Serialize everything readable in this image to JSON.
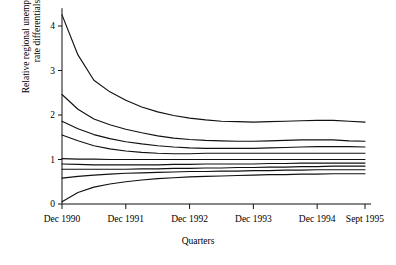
{
  "figure": {
    "background_color": "#ffffff",
    "line_color": "#111111"
  },
  "axes": {
    "y_title": "Relative regional unemployment rate differentials",
    "x_title": "Quarters"
  },
  "chart_data": {
    "type": "line",
    "title": "",
    "xlabel": "Quarters",
    "ylabel": "Relative regional unemployment rate differentials",
    "xlim": [
      0,
      19
    ],
    "ylim": [
      0,
      4.4
    ],
    "grid": false,
    "legend": "none",
    "x_tick_labels": [
      "Dec 1990",
      "Dec 1991",
      "Dec 1992",
      "Dec 1993",
      "Dec 1994",
      "Sept 1995"
    ],
    "x_tick_positions": [
      0,
      4,
      8,
      12,
      16,
      19
    ],
    "y_tick_labels": [
      "0",
      "1",
      "2",
      "3",
      "4"
    ],
    "y_tick_values": [
      0,
      1,
      2,
      3,
      4
    ],
    "x": [
      0,
      1,
      2,
      3,
      4,
      5,
      6,
      7,
      8,
      9,
      10,
      11,
      12,
      13,
      14,
      15,
      16,
      17,
      18,
      19
    ],
    "series": [
      {
        "name": "region-1",
        "values": [
          4.25,
          3.35,
          2.78,
          2.52,
          2.33,
          2.18,
          2.07,
          1.99,
          1.93,
          1.89,
          1.86,
          1.85,
          1.84,
          1.85,
          1.86,
          1.87,
          1.88,
          1.88,
          1.86,
          1.84
        ]
      },
      {
        "name": "region-2",
        "values": [
          2.46,
          2.13,
          1.91,
          1.78,
          1.68,
          1.6,
          1.53,
          1.48,
          1.45,
          1.43,
          1.42,
          1.41,
          1.41,
          1.42,
          1.43,
          1.44,
          1.44,
          1.44,
          1.42,
          1.41
        ]
      },
      {
        "name": "region-3",
        "values": [
          1.86,
          1.69,
          1.56,
          1.47,
          1.4,
          1.35,
          1.31,
          1.28,
          1.26,
          1.25,
          1.25,
          1.25,
          1.25,
          1.26,
          1.27,
          1.28,
          1.29,
          1.29,
          1.29,
          1.28
        ]
      },
      {
        "name": "region-4",
        "values": [
          1.55,
          1.42,
          1.31,
          1.24,
          1.19,
          1.16,
          1.14,
          1.13,
          1.13,
          1.14,
          1.14,
          1.14,
          1.14,
          1.14,
          1.14,
          1.14,
          1.14,
          1.14,
          1.14,
          1.14
        ]
      },
      {
        "name": "region-5",
        "values": [
          1.02,
          1.01,
          1.01,
          1.0,
          1.0,
          1.0,
          1.0,
          1.0,
          1.0,
          1.0,
          1.0,
          1.0,
          1.0,
          1.0,
          1.0,
          1.0,
          1.0,
          1.0,
          1.0,
          1.0
        ]
      },
      {
        "name": "region-6",
        "values": [
          0.9,
          0.89,
          0.88,
          0.88,
          0.88,
          0.88,
          0.88,
          0.89,
          0.89,
          0.9,
          0.9,
          0.9,
          0.9,
          0.91,
          0.91,
          0.92,
          0.92,
          0.92,
          0.92,
          0.92
        ]
      },
      {
        "name": "region-7",
        "values": [
          0.78,
          0.78,
          0.78,
          0.78,
          0.78,
          0.79,
          0.79,
          0.8,
          0.8,
          0.81,
          0.81,
          0.82,
          0.82,
          0.83,
          0.83,
          0.84,
          0.84,
          0.85,
          0.85,
          0.85
        ]
      },
      {
        "name": "region-8",
        "values": [
          0.58,
          0.62,
          0.65,
          0.67,
          0.69,
          0.7,
          0.71,
          0.72,
          0.73,
          0.73,
          0.74,
          0.74,
          0.75,
          0.75,
          0.76,
          0.76,
          0.77,
          0.77,
          0.77,
          0.77
        ]
      },
      {
        "name": "region-9",
        "values": [
          0.05,
          0.26,
          0.38,
          0.45,
          0.5,
          0.54,
          0.57,
          0.59,
          0.61,
          0.62,
          0.63,
          0.64,
          0.65,
          0.66,
          0.66,
          0.67,
          0.67,
          0.68,
          0.68,
          0.68
        ]
      }
    ]
  }
}
